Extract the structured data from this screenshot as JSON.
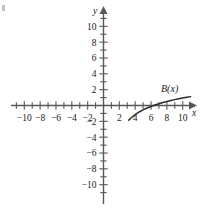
{
  "figure": {
    "title": "",
    "axis_x_label": "x",
    "axis_y_label": "y",
    "curve_label": "B(x)",
    "corner_mark": ""
  },
  "chart_data": {
    "type": "line",
    "title": "",
    "xlabel": "x",
    "ylabel": "y",
    "xlim": [
      -11.5,
      11.5
    ],
    "ylim": [
      -11.5,
      11.5
    ],
    "grid": false,
    "legend": "none",
    "annotations": [
      {
        "text": "B(x)",
        "x": 8.2,
        "y": 2.2
      }
    ],
    "x_tick_labels": [
      "-10",
      "-8",
      "-6",
      "-4",
      "-2",
      "2",
      "4",
      "6",
      "8",
      "10"
    ],
    "x_tick_values": [
      -10,
      -8,
      -6,
      -4,
      -2,
      2,
      4,
      6,
      8,
      10
    ],
    "x_minor_ticks": [
      -11,
      -9,
      -7,
      -5,
      -3,
      -1,
      1,
      3,
      5,
      7,
      9,
      11
    ],
    "y_tick_labels": [
      "10",
      "8",
      "6",
      "4",
      "2",
      "-2",
      "-4",
      "-6",
      "-8",
      "-10"
    ],
    "y_tick_values": [
      10,
      8,
      6,
      4,
      2,
      -2,
      -4,
      -6,
      -8,
      -10
    ],
    "y_minor_ticks": [
      11,
      9,
      7,
      5,
      3,
      1,
      -1,
      -3,
      -5,
      -7,
      -9,
      -11
    ],
    "series": [
      {
        "name": "B(x)",
        "x": [
          3.2,
          3.5,
          4.0,
          4.5,
          5.0,
          5.5,
          6.0,
          6.5,
          7.0,
          7.5,
          8.0,
          8.5,
          9.0,
          9.5,
          10.0,
          10.5,
          11.0
        ],
        "y": [
          -1.85,
          -1.55,
          -1.15,
          -0.82,
          -0.55,
          -0.32,
          -0.12,
          0.06,
          0.22,
          0.37,
          0.5,
          0.63,
          0.74,
          0.85,
          0.95,
          1.04,
          1.12
        ]
      }
    ]
  },
  "style": {
    "axis_color": "#58585a",
    "curve_color": "#2b2b2b",
    "text_color": "#1a1a1a",
    "background": "#ffffff"
  }
}
